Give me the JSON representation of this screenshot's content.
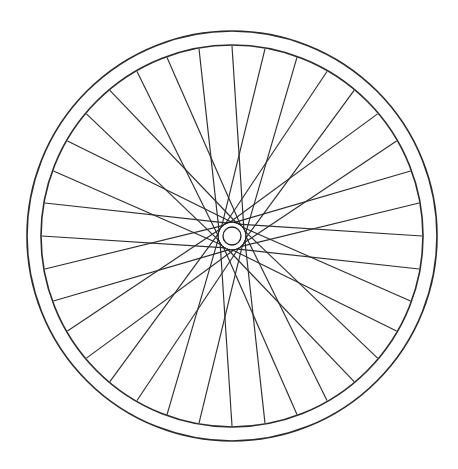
{
  "canvas": {
    "width": 458,
    "height": 469,
    "background_color": "#ffffff",
    "title": "Bicycle Wheel Line Drawing"
  },
  "drawing": {
    "subject": "bicycle-wheel",
    "style": "black-and-white line art / coloring-book outline",
    "stroke_color": "#222222",
    "fill_color": "#ffffff",
    "center_x": 232,
    "center_y": 236
  },
  "rim": {
    "name": "wheel-rim",
    "outer_radius": 205,
    "inner_radius": 191,
    "stroke_width": 1.6,
    "stroke_color": "#2a2a2a",
    "thickness": 14,
    "bounds": {
      "left": 27,
      "right": 437,
      "top": 31,
      "bottom": 441
    }
  },
  "spokes": {
    "name": "wheel-spokes",
    "count": 36,
    "stroke_width": 1.15,
    "stroke_color": "#2d2d2d",
    "lacing": "tangential",
    "hub_attach_radius": 13.5,
    "tangential_offset_degrees": 62,
    "rim_attach_radius": 190,
    "alternating_direction": true
  },
  "hub": {
    "name": "wheel-hub",
    "core_radius": 9,
    "core_fill": "#ffffff",
    "flange_radius": 14,
    "stroke_width": 1.3,
    "stroke_color": "#1f1f1f"
  },
  "chart_data": {
    "type": "scatter",
    "xlabel": "",
    "ylabel": "",
    "categories": [],
    "values": []
  }
}
